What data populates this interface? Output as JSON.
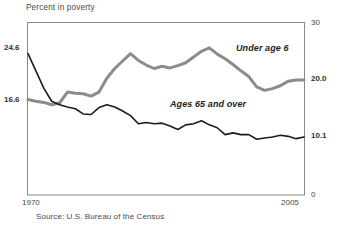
{
  "chart_data": {
    "type": "line",
    "title": "Percent in poverty",
    "xlabel": "",
    "ylabel": "",
    "grid": false,
    "legend_position": "inline-annotation",
    "xlim": [
      1970,
      2005
    ],
    "ylim": [
      0,
      30
    ],
    "x_ticks": [
      "1970",
      "2005"
    ],
    "y_ticks_right": [
      "0",
      "10.1",
      "20.0",
      "30"
    ],
    "y_ticks_left": [
      "16.6",
      "24.6"
    ],
    "annotations": [
      "Under age 6",
      "Ages 65 and over"
    ],
    "source": "Source:  U.S. Bureau of the Census",
    "x": [
      1970,
      1971,
      1972,
      1973,
      1974,
      1975,
      1976,
      1977,
      1978,
      1979,
      1980,
      1981,
      1982,
      1983,
      1984,
      1985,
      1986,
      1987,
      1988,
      1989,
      1990,
      1991,
      1992,
      1993,
      1994,
      1995,
      1996,
      1997,
      1998,
      1999,
      2000,
      2001,
      2002,
      2003,
      2004,
      2005
    ],
    "series": [
      {
        "name": "Under age 6",
        "color": "#8c8c8c",
        "values": [
          16.6,
          16.3,
          16.1,
          15.7,
          16.0,
          17.9,
          17.7,
          17.6,
          17.2,
          17.9,
          20.3,
          22.0,
          23.3,
          24.6,
          23.4,
          22.6,
          22.0,
          22.4,
          22.1,
          22.5,
          23.0,
          24.0,
          25.0,
          25.6,
          24.5,
          23.7,
          22.7,
          21.6,
          20.6,
          18.8,
          18.2,
          18.5,
          19.0,
          19.8,
          20.0,
          20.0
        ]
      },
      {
        "name": "Ages 65 and over",
        "color": "#1c1c1c",
        "values": [
          24.6,
          21.6,
          18.6,
          16.3,
          15.7,
          15.3,
          15.0,
          14.1,
          14.0,
          15.2,
          15.7,
          15.3,
          14.6,
          13.8,
          12.4,
          12.6,
          12.4,
          12.5,
          12.0,
          11.4,
          12.2,
          12.4,
          12.9,
          12.2,
          11.7,
          10.5,
          10.8,
          10.5,
          10.5,
          9.7,
          9.9,
          10.1,
          10.4,
          10.2,
          9.8,
          10.1
        ]
      }
    ]
  },
  "axis": {
    "left_upper": "24.6",
    "left_lower": "16.6",
    "right_top": "30",
    "right_mid_upper": "20.0",
    "right_mid_lower": "10.1",
    "right_bottom": "0",
    "x_start": "1970",
    "x_end": "2005"
  },
  "annotations": {
    "under_age_6": "Under age 6",
    "ages_65_and_over": "Ages 65 and over"
  },
  "footer": {
    "source": "Source:  U.S. Bureau of the Census"
  }
}
